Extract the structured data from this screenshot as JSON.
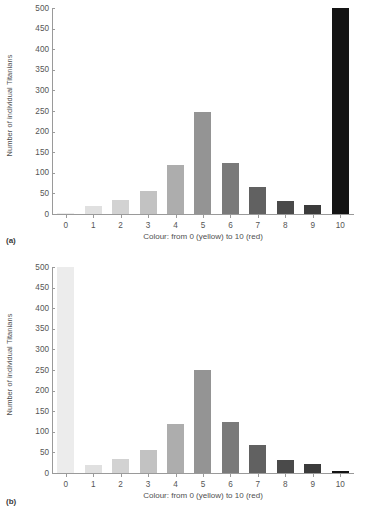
{
  "figure": {
    "panels": [
      {
        "label": "(a)",
        "label_name": "panel-label-a"
      },
      {
        "label": "(b)",
        "label_name": "panel-label-b"
      }
    ]
  },
  "axis": {
    "ylabel": "Number of individual Titanians",
    "xlabel": "Colour: from 0 (yellow) to 10 (red)",
    "yticks": [
      500,
      450,
      400,
      350,
      300,
      250,
      200,
      150,
      100,
      50,
      0
    ],
    "xticks": [
      "0",
      "1",
      "2",
      "3",
      "4",
      "5",
      "6",
      "7",
      "8",
      "9",
      "10"
    ]
  },
  "bar_colors": [
    "#ececec",
    "#e0e0e0",
    "#d2d2d2",
    "#c2c2c2",
    "#adadad",
    "#949494",
    "#7a7a7a",
    "#616161",
    "#4a4a4a",
    "#3b3b3b",
    "#141414"
  ],
  "chart_data": [
    {
      "type": "bar",
      "title": "(a)",
      "categories": [
        "0",
        "1",
        "2",
        "3",
        "4",
        "5",
        "6",
        "7",
        "8",
        "9",
        "10"
      ],
      "values": [
        2,
        19,
        33,
        55,
        118,
        248,
        124,
        66,
        31,
        22,
        500
      ],
      "xlabel": "Colour: from 0 (yellow) to 10 (red)",
      "ylabel": "Number of individual Titanians",
      "ylim": [
        0,
        500
      ],
      "ytick_step": 50,
      "grid": false,
      "legend": false
    },
    {
      "type": "bar",
      "title": "(b)",
      "categories": [
        "0",
        "1",
        "2",
        "3",
        "4",
        "5",
        "6",
        "7",
        "8",
        "9",
        "10"
      ],
      "values": [
        500,
        19,
        33,
        56,
        118,
        249,
        124,
        67,
        31,
        22,
        5
      ],
      "xlabel": "Colour: from 0 (yellow) to 10 (red)",
      "ylabel": "Number of individual Titanians",
      "ylim": [
        0,
        500
      ],
      "ytick_step": 50,
      "grid": false,
      "legend": false
    }
  ]
}
